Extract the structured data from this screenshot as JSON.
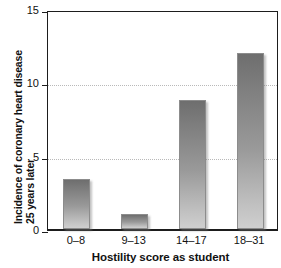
{
  "chart_data": {
    "type": "bar",
    "title": "",
    "categories": [
      "0–8",
      "9–13",
      "14–17",
      "18–31"
    ],
    "values": [
      3.4,
      1.0,
      8.8,
      12.0
    ],
    "xlabel": "Hostility score as student",
    "ylabel_line1": "Incidence of coronary heart disease",
    "ylabel_line2": "25 years later",
    "ylim": [
      0,
      15
    ],
    "yticks": [
      0,
      5,
      10,
      15
    ],
    "ytick_labels": [
      "0",
      "5",
      "10",
      "15"
    ],
    "gridlines": [
      5,
      10
    ],
    "grid": "horizontal-dotted",
    "legend": "none",
    "bar_color": "#8c8c8c",
    "bar_gradient_top": "#6e6e6e",
    "bar_gradient_bottom": "#cfcfcf",
    "axis_color": "#1d1d1d",
    "grid_color": "#b9b9b9",
    "background": "#ffffff"
  }
}
